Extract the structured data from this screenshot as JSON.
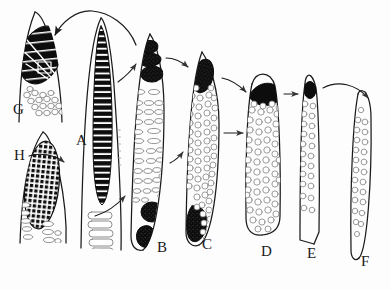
{
  "figure": {
    "type": "line-drawing-diagram",
    "background_color": "#fdfdfd",
    "ink_color": "#1a1a1a",
    "fill_dark": "#0d0d0d",
    "fill_light": "#ffffff",
    "granule_stroke": "#8a8a8a",
    "width": 391,
    "height": 290
  },
  "labels": [
    {
      "id": "G",
      "text": "G",
      "x": 13,
      "y": 101
    },
    {
      "id": "A",
      "text": "A",
      "x": 76,
      "y": 132
    },
    {
      "id": "H",
      "text": "H",
      "x": 14,
      "y": 147
    },
    {
      "id": "B",
      "text": "B",
      "x": 157,
      "y": 239
    },
    {
      "id": "C",
      "text": "C",
      "x": 202,
      "y": 236
    },
    {
      "id": "D",
      "text": "D",
      "x": 261,
      "y": 243
    },
    {
      "id": "E",
      "text": "E",
      "x": 307,
      "y": 245
    },
    {
      "id": "F",
      "text": "F",
      "x": 361,
      "y": 253
    }
  ],
  "cells": [
    {
      "id": "G",
      "label": "G",
      "shape": "tapered-spindle-top-left",
      "nucleus": "large-dark-striated-oval",
      "granules": "small-open-circles-cluster",
      "granule_count": 17
    },
    {
      "id": "H",
      "label": "H",
      "shape": "tapered-spindle-lower-left",
      "nucleus": "dark-checkerboard-grid-oval",
      "granules": "small-open-ellipses",
      "granule_count": 10
    },
    {
      "id": "A",
      "label": "A",
      "shape": "long-tapered-blade",
      "nucleus": "banded-striped-column",
      "band_count": 30,
      "granules": "stacked-elongated-ovals",
      "granule_count": 6
    },
    {
      "id": "B",
      "label": "B",
      "shape": "long-curved-blade",
      "nucleus_top": "segmented-dark-mass-3-lobes",
      "nucleus_bottom": "dark-rounded-mass-2-lobes",
      "granules": "open-elongated-ovals",
      "granule_count": 34
    },
    {
      "id": "C",
      "label": "C",
      "shape": "long-curved-blade",
      "nucleus_top": "dark-oval-mass",
      "nucleus_bottom": "dark-teardrop-mass",
      "granules": "open-round-circles",
      "granule_count": 58
    },
    {
      "id": "D",
      "label": "D",
      "shape": "blunt-ended-column",
      "nucleus_top": "dark-crescent-cap",
      "granules": "open-round-circles",
      "granule_count": 52
    },
    {
      "id": "E",
      "label": "E",
      "shape": "narrow-tapered-sliver",
      "nucleus_top": "small-dark-oval",
      "granules": "sparse-open-circles",
      "granule_count": 22
    },
    {
      "id": "F",
      "label": "F",
      "shape": "pointed-spindle",
      "nucleus_top": "none",
      "granules": "sparse-open-circles",
      "granule_count": 24
    }
  ],
  "arrows": [
    {
      "id": "b-to-g",
      "from": "B",
      "to": "G",
      "style": "long-arc-over-A",
      "direction": "right-to-left"
    },
    {
      "id": "a-to-b",
      "from": "A",
      "to": "B",
      "style": "short-straight",
      "direction": "left-to-right-up"
    },
    {
      "id": "h-to-a",
      "from": "H",
      "to": "A",
      "style": "short-curve",
      "direction": "left-to-right"
    },
    {
      "id": "b-to-c",
      "from": "B",
      "to": "C",
      "style": "short-curve",
      "direction": "left-to-right"
    },
    {
      "id": "b2-to-c",
      "from": "B",
      "to": "C",
      "style": "short-straight-up",
      "direction": "left-to-right-up"
    },
    {
      "id": "c-to-d",
      "from": "C",
      "to": "D",
      "style": "straight-horizontal",
      "direction": "left-to-right"
    },
    {
      "id": "d-to-e",
      "from": "D",
      "to": "E",
      "style": "straight-horizontal",
      "direction": "left-to-right"
    },
    {
      "id": "e-to-f",
      "from": "E",
      "to": "F",
      "style": "long-curve",
      "direction": "left-to-right"
    }
  ]
}
